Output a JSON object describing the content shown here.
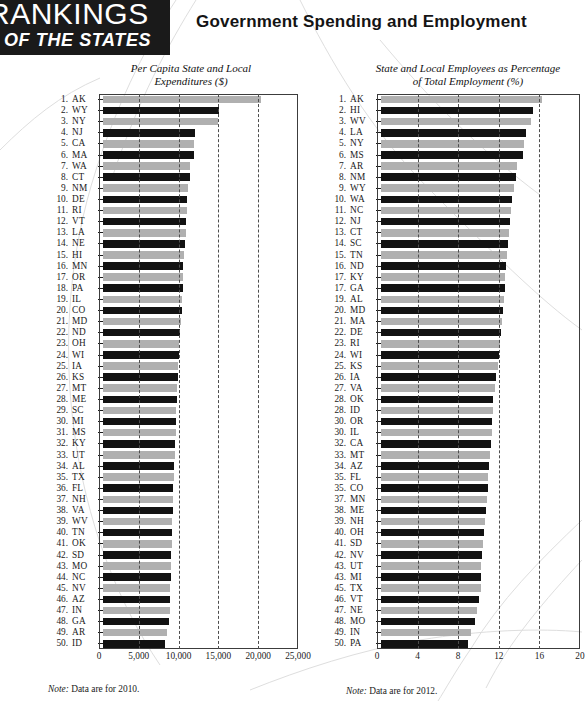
{
  "brand": {
    "line1": "RANKINGS",
    "line2": "OF THE STATES"
  },
  "header": {
    "title": "Government Spending and Employment"
  },
  "notes": {
    "left_label": "Note:",
    "left_text": " Data are for 2010.",
    "right_label": "Note:",
    "right_text": " Data are for 2012."
  },
  "chart_data": [
    {
      "id": "left",
      "type": "bar",
      "orientation": "horizontal",
      "title": "Per Capita State and Local Expenditures ($)",
      "xlabel": "",
      "ylabel": "",
      "xlim": [
        0,
        25000
      ],
      "ticks": [
        "0",
        "5,000",
        "10,000",
        "15,000",
        "20,000",
        "25,000"
      ],
      "tick_values": [
        0,
        5000,
        10000,
        15000,
        20000,
        25000
      ],
      "grid": "dashed-vertical",
      "note": "Note: Data are for 2010.",
      "categories": [
        "AK",
        "WY",
        "NY",
        "NJ",
        "CA",
        "MA",
        "WA",
        "CT",
        "NM",
        "DE",
        "RI",
        "VT",
        "LA",
        "NE",
        "HI",
        "MN",
        "OR",
        "PA",
        "IL",
        "CO",
        "MD",
        "ND",
        "OH",
        "WI",
        "IA",
        "KS",
        "MT",
        "ME",
        "SC",
        "MI",
        "MS",
        "KY",
        "UT",
        "AL",
        "TX",
        "FL",
        "NH",
        "VA",
        "WV",
        "TN",
        "OK",
        "SD",
        "MO",
        "NC",
        "NV",
        "AZ",
        "IN",
        "GA",
        "AR",
        "ID"
      ],
      "ranks": [
        "1.",
        "2.",
        "3.",
        "4.",
        "5.",
        "6.",
        "7.",
        "8.",
        "9.",
        "10.",
        "11.",
        "12.",
        "13.",
        "14.",
        "15.",
        "16.",
        "17.",
        "18.",
        "19.",
        "20.",
        "21.",
        "22.",
        "23.",
        "24.",
        "25.",
        "26.",
        "27.",
        "28.",
        "29.",
        "30.",
        "31.",
        "32.",
        "33.",
        "34.",
        "35.",
        "36.",
        "37.",
        "38.",
        "39.",
        "40.",
        "41.",
        "42.",
        "43.",
        "44.",
        "45.",
        "46.",
        "47.",
        "48.",
        "49.",
        "50."
      ],
      "values": [
        20300,
        14900,
        14800,
        11800,
        11700,
        11700,
        11200,
        11100,
        10900,
        10800,
        10800,
        10700,
        10600,
        10500,
        10400,
        10300,
        10200,
        10200,
        10100,
        10100,
        10000,
        9900,
        9800,
        9700,
        9600,
        9600,
        9500,
        9500,
        9400,
        9300,
        9300,
        9200,
        9200,
        9100,
        9100,
        9000,
        9000,
        8950,
        8900,
        8850,
        8800,
        8750,
        8700,
        8700,
        8650,
        8600,
        8550,
        8400,
        8200,
        7900
      ]
    },
    {
      "id": "right",
      "type": "bar",
      "orientation": "horizontal",
      "title": "State and Local Employees as Percentage of Total Employment (%)",
      "xlabel": "",
      "ylabel": "",
      "xlim": [
        0,
        20
      ],
      "ticks": [
        "0",
        "4",
        "8",
        "12",
        "16",
        "20"
      ],
      "tick_values": [
        0,
        4,
        8,
        12,
        16,
        20
      ],
      "grid": "dashed-vertical",
      "note": "Note: Data are for 2012.",
      "categories": [
        "AK",
        "HI",
        "WV",
        "LA",
        "NY",
        "MS",
        "AR",
        "NM",
        "WY",
        "WA",
        "NC",
        "NJ",
        "CT",
        "SC",
        "TN",
        "ND",
        "KY",
        "GA",
        "AL",
        "MD",
        "MA",
        "DE",
        "RI",
        "WI",
        "KS",
        "IA",
        "VA",
        "OK",
        "ID",
        "OR",
        "IL",
        "CA",
        "MT",
        "AZ",
        "FL",
        "CO",
        "MN",
        "ME",
        "NH",
        "OH",
        "SD",
        "NV",
        "UT",
        "MI",
        "TX",
        "VT",
        "NE",
        "MO",
        "IN",
        "PA"
      ],
      "ranks": [
        "1.",
        "2.",
        "3.",
        "4.",
        "5.",
        "6.",
        "7.",
        "8.",
        "9.",
        "10.",
        "11.",
        "12.",
        "13.",
        "14.",
        "15.",
        "16.",
        "17.",
        "17.",
        "19.",
        "20.",
        "21.",
        "22.",
        "23.",
        "24.",
        "25.",
        "26.",
        "27.",
        "28.",
        "28.",
        "30.",
        "30.",
        "32.",
        "33.",
        "34.",
        "35.",
        "35.",
        "37.",
        "38.",
        "39.",
        "40.",
        "41.",
        "42.",
        "43.",
        "43.",
        "45.",
        "46.",
        "47.",
        "48.",
        "49.",
        "50."
      ],
      "values": [
        16.2,
        15.3,
        15.1,
        14.6,
        14.4,
        14.3,
        13.7,
        13.6,
        13.4,
        13.2,
        13.1,
        13.0,
        12.9,
        12.8,
        12.7,
        12.6,
        12.5,
        12.5,
        12.4,
        12.3,
        12.2,
        12.1,
        12.0,
        11.9,
        11.8,
        11.6,
        11.5,
        11.3,
        11.3,
        11.2,
        11.2,
        11.1,
        11.0,
        10.9,
        10.8,
        10.8,
        10.7,
        10.6,
        10.5,
        10.4,
        10.3,
        10.2,
        10.1,
        10.1,
        10.0,
        9.8,
        9.6,
        9.4,
        9.0,
        8.7
      ]
    }
  ]
}
